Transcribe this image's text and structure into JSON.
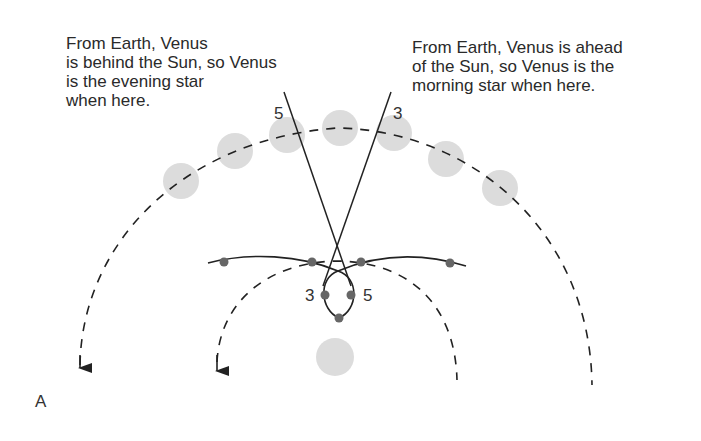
{
  "captions": {
    "left": "From Earth, Venus\nis behind the Sun, so Venus\nis the evening star\nwhen here.",
    "right": "From Earth, Venus is ahead\nof the Sun, so Venus is the\nmorning star when here."
  },
  "labels": {
    "outer_5": "5",
    "outer_3": "3",
    "loop_3": "3",
    "loop_5": "5",
    "panel": "A"
  },
  "colors": {
    "disc": "#dcdcdc",
    "dot": "#666666",
    "line": "#222222"
  }
}
